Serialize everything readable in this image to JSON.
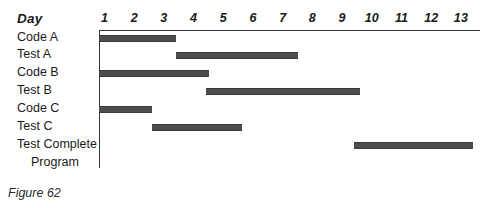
{
  "figure": {
    "caption": "Figure 62",
    "axis_title": "Day"
  },
  "chart_data": {
    "type": "bar",
    "orientation": "horizontal",
    "subtype": "gantt",
    "title": "",
    "xlabel": "Day",
    "ylabel": "",
    "xlim": [
      0,
      13.8
    ],
    "grid": false,
    "legend": null,
    "bar_color": "#4d4d4d",
    "axis_color": "#333333",
    "tick_labels": [
      "1",
      "2",
      "3",
      "4",
      "5",
      "6",
      "7",
      "8",
      "9",
      "10",
      "11",
      "12",
      "13"
    ],
    "tick_values": [
      1,
      2,
      3,
      4,
      5,
      6,
      7,
      8,
      9,
      10,
      11,
      12,
      13
    ],
    "categories": [
      "Code A",
      "Test A",
      "Code B",
      "Test B",
      "Code C",
      "Test C",
      "Test Complete Program"
    ],
    "tasks": [
      {
        "label": "Code A",
        "label_line1": "Code A",
        "label_line2": "",
        "start": 1.0,
        "end": 3.6,
        "duration": 2.6
      },
      {
        "label": "Test A",
        "label_line1": "Test A",
        "label_line2": "",
        "start": 3.6,
        "end": 7.7,
        "duration": 4.1
      },
      {
        "label": "Code B",
        "label_line1": "Code B",
        "label_line2": "",
        "start": 1.0,
        "end": 4.7,
        "duration": 3.7
      },
      {
        "label": "Test B",
        "label_line1": "Test B",
        "label_line2": "",
        "start": 4.6,
        "end": 9.8,
        "duration": 5.2
      },
      {
        "label": "Code C",
        "label_line1": "Code C",
        "label_line2": "",
        "start": 1.0,
        "end": 2.8,
        "duration": 1.8
      },
      {
        "label": "Test C",
        "label_line1": "Test C",
        "label_line2": "",
        "start": 2.8,
        "end": 5.8,
        "duration": 3.0
      },
      {
        "label": "Test Complete Program",
        "label_line1": "Test Complete",
        "label_line2": "Program",
        "start": 9.6,
        "end": 13.6,
        "duration": 4.0
      }
    ]
  }
}
